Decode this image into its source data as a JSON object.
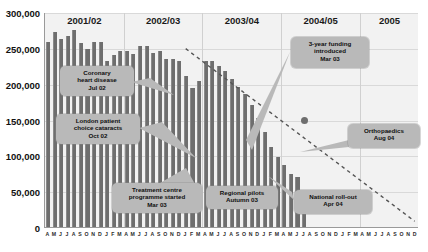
{
  "chart_data": {
    "type": "bar",
    "title": "",
    "xlabel": "",
    "ylabel": "",
    "ylim": [
      0,
      300000
    ],
    "ytick_labels": [
      "300,000",
      "250,000",
      "200,000",
      "150,000",
      "100,000",
      "50,000",
      "0"
    ],
    "ytick_values": [
      300000,
      250000,
      200000,
      150000,
      100000,
      50000,
      0
    ],
    "grid": true,
    "legend_position": "none",
    "x_start": "Apr 2001",
    "x_end": "Dec 2005",
    "categories": [
      "A",
      "M",
      "J",
      "J",
      "A",
      "S",
      "O",
      "N",
      "D",
      "J",
      "F",
      "M",
      "A",
      "M",
      "J",
      "J",
      "A",
      "S",
      "O",
      "N",
      "D",
      "J",
      "F",
      "M",
      "A",
      "M",
      "J",
      "J",
      "A",
      "S",
      "O",
      "N",
      "D",
      "J",
      "F",
      "M",
      "A",
      "M",
      "J",
      "J",
      "A",
      "S",
      "O",
      "N",
      "D",
      "J",
      "F",
      "M",
      "A",
      "M",
      "J",
      "J",
      "A",
      "S",
      "O",
      "N",
      "D"
    ],
    "values": [
      258000,
      272000,
      262000,
      266000,
      275000,
      257000,
      248000,
      258000,
      258000,
      232000,
      240000,
      245000,
      246000,
      241000,
      252000,
      252000,
      243000,
      246000,
      234000,
      234000,
      231000,
      211000,
      194000,
      204000,
      232000,
      231000,
      225000,
      218000,
      206000,
      196000,
      186000,
      170000,
      152000,
      132000,
      112000,
      98000,
      86000,
      74000,
      70000,
      40000,
      0,
      0,
      0,
      0,
      0,
      0,
      0,
      0,
      0,
      0,
      0,
      0,
      0,
      0,
      0,
      0,
      0
    ],
    "series": [
      {
        "name": "Waiting list",
        "type": "bar",
        "color": "#6e6e6e"
      },
      {
        "name": "Trend",
        "type": "line",
        "style": "dashed",
        "color": "#555555"
      }
    ],
    "trend_line": {
      "style": "dashed",
      "start": {
        "x_index": 21,
        "value": 250000
      },
      "end": {
        "x_index": 56,
        "value": 8000
      }
    },
    "marker_point": {
      "x_index": 39,
      "value": 150000
    }
  },
  "year_bands": [
    {
      "label": "2001/02",
      "start_index": 0,
      "end_index": 11
    },
    {
      "label": "2002/03",
      "start_index": 12,
      "end_index": 23
    },
    {
      "label": "2003/04",
      "start_index": 24,
      "end_index": 35
    },
    {
      "label": "2004/05",
      "start_index": 36,
      "end_index": 47
    },
    {
      "label": "2005",
      "start_index": 48,
      "end_index": 56
    }
  ],
  "annotations": [
    {
      "name": "coronary-heart-disease",
      "lines": [
        "Coronary",
        "heart disease",
        "Jul 02"
      ],
      "box": {
        "left": 60,
        "top": 66,
        "width": 74,
        "height": 30
      }
    },
    {
      "name": "london-patient-choice-cataracts",
      "lines": [
        "London patient",
        "choice cataracts",
        "Oct 02"
      ],
      "box": {
        "left": 56,
        "top": 114,
        "width": 84,
        "height": 30
      }
    },
    {
      "name": "treatment-centre-programme-started",
      "lines": [
        "Treatment centre",
        "programme started",
        "Mar 03"
      ],
      "box": {
        "left": 112,
        "top": 183,
        "width": 90,
        "height": 30
      }
    },
    {
      "name": "regional-pilots",
      "lines": [
        "Regional pilots",
        "Autumn 03"
      ],
      "box": {
        "left": 206,
        "top": 186,
        "width": 72,
        "height": 23
      }
    },
    {
      "name": "three-year-funding-introduced",
      "lines": [
        "3-year funding",
        "introduced",
        "Mar 03"
      ],
      "box": {
        "left": 291,
        "top": 37,
        "width": 78,
        "height": 31
      }
    },
    {
      "name": "orthopaedics",
      "lines": [
        "Orthopaedics",
        "Aug 04"
      ],
      "box": {
        "left": 348,
        "top": 124,
        "width": 72,
        "height": 24
      }
    },
    {
      "name": "national-roll-out",
      "lines": [
        "National roll-out",
        "Apr 04"
      ],
      "box": {
        "left": 294,
        "top": 190,
        "width": 78,
        "height": 24
      }
    }
  ]
}
